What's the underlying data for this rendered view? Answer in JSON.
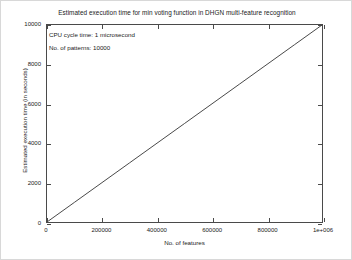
{
  "chart_data": {
    "type": "line",
    "title": "Estimated execution time for min voting function in DHGN multi-feature recognition",
    "xlabel": "No. of features",
    "ylabel": "Estimated execution time (in seconds)",
    "xlim": [
      0,
      1000000
    ],
    "ylim": [
      0,
      10000
    ],
    "grid": false,
    "legend": null,
    "xticks": [
      0,
      200000,
      400000,
      600000,
      800000,
      1000000
    ],
    "xtick_labels": [
      "0",
      "200000",
      "400000",
      "600000",
      "800000",
      "1e+006"
    ],
    "yticks": [
      0,
      2000,
      4000,
      6000,
      8000,
      10000
    ],
    "ytick_labels": [
      "0",
      "2000",
      "4000",
      "6000",
      "8000",
      "10000"
    ],
    "series": [
      {
        "name": "estimated-execution-time",
        "color": "#333333",
        "x": [
          0,
          100000,
          200000,
          300000,
          400000,
          500000,
          600000,
          700000,
          800000,
          900000,
          1000000
        ],
        "values": [
          0,
          1000,
          2000,
          3000,
          4000,
          5000,
          6000,
          7000,
          8000,
          9000,
          10000
        ]
      }
    ],
    "annotations": [
      "CPU cycle time: 1 microsecond",
      "No. of patterns: 10000"
    ]
  },
  "colors": {
    "axis": "#4a4a4a",
    "text": "#1a1a1a",
    "line": "#333333",
    "background": "#ffffff",
    "frame": "#d8d8d8"
  }
}
